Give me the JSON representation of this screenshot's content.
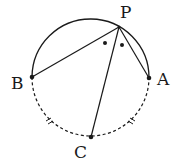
{
  "diagram": {
    "type": "geometry-circle",
    "circle": {
      "cx": 90,
      "cy": 80,
      "r": 58
    },
    "points": {
      "P": {
        "label": "P",
        "x": 119,
        "y": 27
      },
      "A": {
        "label": "A",
        "x": 149,
        "y": 78
      },
      "B": {
        "label": "B",
        "x": 32,
        "y": 77
      },
      "C": {
        "label": "C",
        "x": 91,
        "y": 137
      }
    },
    "segments": [
      "PB",
      "PA",
      "PC"
    ],
    "arcs": {
      "upper": "solid arc B–P–A",
      "lower": "dashed arc B–C–A with equal-length tick marks on arcs BC and CA"
    },
    "angle_marks": "equal angles BPC and CPA marked with dots",
    "colors": {
      "stroke": "#1a1a1a",
      "background": "#ffffff"
    }
  }
}
